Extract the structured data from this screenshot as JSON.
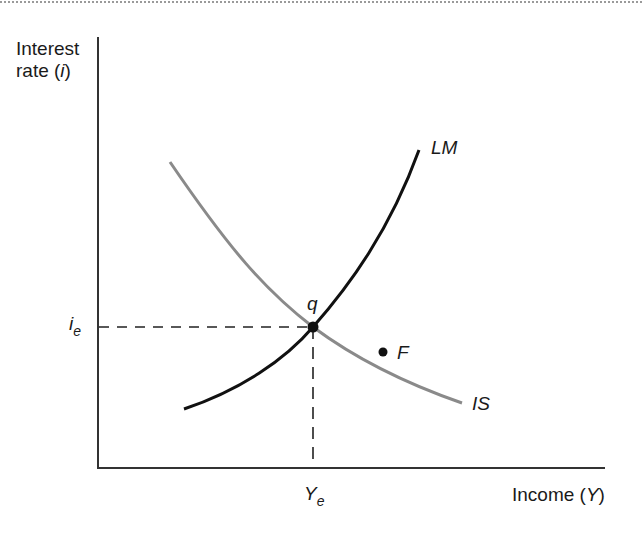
{
  "diagram": {
    "type": "IS-LM model",
    "y_axis_label": {
      "line1": "Interest",
      "line2_prefix": "rate (",
      "line2_var": "i",
      "line2_suffix": ")"
    },
    "x_axis_label": {
      "prefix": "Income (",
      "var": "Y",
      "suffix": ")"
    },
    "equilibrium_rate": {
      "base": "i",
      "sub": "e"
    },
    "equilibrium_income": {
      "base": "Y",
      "sub": "e"
    },
    "curves": [
      {
        "name": "LM",
        "label": "LM",
        "color": "#111111",
        "slope": "upward"
      },
      {
        "name": "IS",
        "label": "IS",
        "color": "#888888",
        "slope": "downward"
      }
    ],
    "points": [
      {
        "name": "q",
        "label": "q",
        "meaning": "equilibrium (IS = LM)"
      },
      {
        "name": "F",
        "label": "F",
        "meaning": "point off equilibrium"
      }
    ],
    "colors": {
      "axis": "#333333",
      "lm": "#111111",
      "is": "#8a8a8a",
      "guides": "#222222"
    }
  }
}
